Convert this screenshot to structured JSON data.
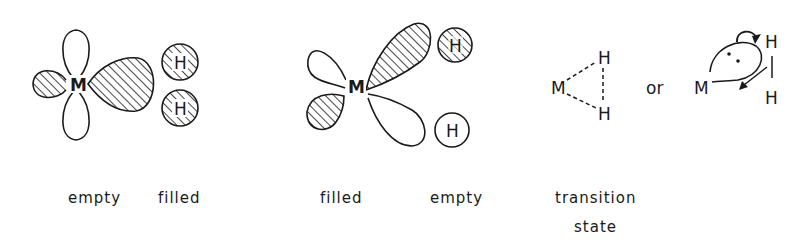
{
  "figure": {
    "panels": [
      {
        "id": "panel-1",
        "center_atom": "M",
        "ligand_atoms": [
          "H",
          "H"
        ],
        "metal_orbital_label": "empty",
        "ligand_orbital_label": "filled"
      },
      {
        "id": "panel-2",
        "center_atom": "M",
        "ligand_atoms": [
          "H",
          "H"
        ],
        "metal_orbital_label": "filled",
        "ligand_orbital_label": "empty"
      },
      {
        "id": "panel-3",
        "left_structure_atoms": [
          "M",
          "H",
          "H"
        ],
        "connector": "or",
        "right_structure_atoms": [
          "M",
          "H",
          "H"
        ],
        "label_line1": "transition",
        "label_line2": "state"
      }
    ]
  },
  "colors": {
    "ink": "#1a1a1a",
    "background": "#ffffff"
  }
}
